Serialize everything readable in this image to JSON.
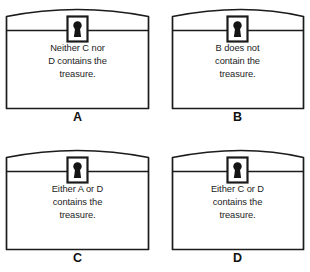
{
  "figure": {
    "kind": "treasure-chest-logic-puzzle",
    "grid": {
      "rows": 2,
      "columns": 2
    },
    "stroke_color": "#1b1b1b",
    "fill_color": "#ffffff",
    "background_color": "#ffffff"
  },
  "chests": [
    {
      "id": "chest-a",
      "label": "A",
      "lock_icon": "keyhole-icon",
      "lines": [
        "Neither C nor",
        "D contains the",
        "treasure."
      ],
      "statement": "Neither C nor D contains the treasure."
    },
    {
      "id": "chest-b",
      "label": "B",
      "lock_icon": "keyhole-icon",
      "lines": [
        "B does not",
        "contain the",
        "treasure."
      ],
      "statement": "B does not contain the treasure."
    },
    {
      "id": "chest-c",
      "label": "C",
      "lock_icon": "keyhole-icon",
      "lines": [
        "Either A or D",
        "contains the",
        "treasure."
      ],
      "statement": "Either A or D contains the treasure."
    },
    {
      "id": "chest-d",
      "label": "D",
      "lock_icon": "keyhole-icon",
      "lines": [
        "Either C or D",
        "contains the",
        "treasure."
      ],
      "statement": "Either C or D contains the treasure."
    }
  ]
}
